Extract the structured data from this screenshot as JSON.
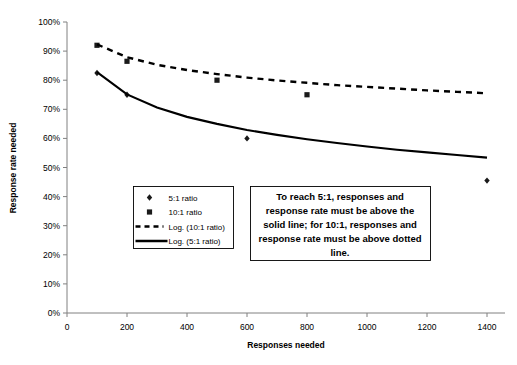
{
  "chart_data": {
    "type": "scatter",
    "title": "",
    "xlabel": "Responses needed",
    "ylabel": "Response rate needed",
    "xlim": [
      0,
      1460
    ],
    "ylim": [
      0,
      100
    ],
    "xticks": [
      0,
      200,
      400,
      600,
      800,
      1000,
      1200,
      1400
    ],
    "xtick_labels": [
      "0",
      "200",
      "400",
      "600",
      "800",
      "1000",
      "1200",
      "1400"
    ],
    "yticks": [
      0,
      10,
      20,
      30,
      40,
      50,
      60,
      70,
      80,
      90,
      100
    ],
    "ytick_labels": [
      "0%",
      "10%",
      "20%",
      "30%",
      "40%",
      "50%",
      "60%",
      "70%",
      "80%",
      "90%",
      "100%"
    ],
    "grid": false,
    "legend_position": "center-left-inside",
    "series": [
      {
        "name": "5:1 ratio",
        "type": "scatter",
        "marker": "diamond",
        "x": [
          100,
          200,
          600,
          1400
        ],
        "y": [
          82.5,
          75.0,
          60.0,
          45.5
        ]
      },
      {
        "name": "10:1 ratio",
        "type": "scatter",
        "marker": "square",
        "x": [
          100,
          200,
          500,
          800
        ],
        "y": [
          92.0,
          86.5,
          80.0,
          75.0
        ]
      },
      {
        "name": "Log. (10:1 ratio)",
        "type": "line",
        "style": "dashed",
        "x": [
          100,
          200,
          300,
          400,
          500,
          600,
          700,
          800,
          900,
          1000,
          1100,
          1200,
          1300,
          1400
        ],
        "y": [
          92.3,
          87.9,
          85.3,
          83.5,
          82.1,
          80.9,
          79.9,
          79.1,
          78.3,
          77.7,
          77.1,
          76.5,
          76.0,
          75.5
        ]
      },
      {
        "name": "Log. (5:1 ratio)",
        "type": "line",
        "style": "solid",
        "x": [
          100,
          200,
          300,
          400,
          500,
          600,
          700,
          800,
          900,
          1000,
          1100,
          1200,
          1300,
          1400
        ],
        "y": [
          82.8,
          75.1,
          70.6,
          67.4,
          65.0,
          62.9,
          61.2,
          59.7,
          58.4,
          57.2,
          56.1,
          55.2,
          54.3,
          53.4
        ]
      }
    ],
    "legend_entries": [
      {
        "label": "5:1 ratio",
        "swatch": "diamond-marker"
      },
      {
        "label": "10:1 ratio",
        "swatch": "square-marker"
      },
      {
        "label": "Log. (10:1 ratio)",
        "swatch": "dashed-line"
      },
      {
        "label": "Log. (5:1 ratio)",
        "swatch": "solid-line"
      }
    ],
    "annotations": [
      {
        "name": "instruction-note",
        "lines": [
          "To reach 5:1, responses and",
          "response rate must be above the",
          "solid line; for 10:1, responses and",
          "response rate must be above dotted",
          "line."
        ]
      }
    ],
    "colors": {
      "series": "#000000",
      "axis": "#808080",
      "background": "#ffffff"
    }
  }
}
